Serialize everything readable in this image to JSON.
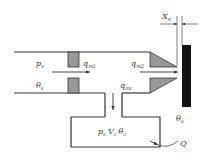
{
  "diagram": {
    "type": "nozzle-flapper-valve-schematic",
    "labels": {
      "supply_pressure": {
        "main": "p",
        "sub": "s"
      },
      "supply_temperature": {
        "main": "θ",
        "sub": "s"
      },
      "flow_orifice": {
        "main": "q",
        "sub": "m1"
      },
      "flow_nozzle": {
        "main": "q",
        "sub": "m2"
      },
      "flow_chamber": {
        "main": "q",
        "sub": "mc"
      },
      "gap": {
        "main": "X",
        "sub": "n"
      },
      "ambient_temperature": {
        "main": "θ",
        "sub": "a"
      },
      "chamber_state": {
        "p": "p",
        "p_sub": "c",
        "v": "V",
        "v_sub": "c",
        "t": "θ",
        "t_sub": "c"
      },
      "heat": "Q"
    },
    "colors": {
      "line": "#333333",
      "block_fill": "#999999",
      "baffle_fill": "#111111",
      "background": "#ffffff"
    }
  }
}
